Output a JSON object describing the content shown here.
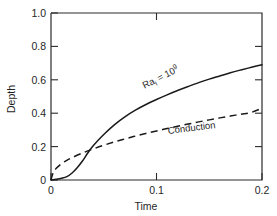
{
  "chart_data": {
    "type": "line",
    "title": "",
    "subtitle": "",
    "xlabel": "Time",
    "ylabel": "Depth",
    "xlim": [
      0,
      0.2
    ],
    "ylim": [
      0,
      1.0
    ],
    "grid": false,
    "legend_position": "inline-annotation",
    "xticks": [
      0,
      0.1,
      0.2
    ],
    "xticklabels": [
      "0",
      "0.1",
      "0.2"
    ],
    "yticks": [
      0,
      0.2,
      0.4,
      0.6,
      0.8,
      1.0
    ],
    "yticklabels": [
      "0",
      "0.2",
      "0.4",
      "0.6",
      "0.8",
      "1.0"
    ],
    "series": [
      {
        "name": "Ra_i = 10^9",
        "style": "solid",
        "x": [
          0,
          0.005,
          0.01,
          0.015,
          0.02,
          0.025,
          0.03,
          0.035,
          0.04,
          0.05,
          0.06,
          0.07,
          0.08,
          0.09,
          0.1,
          0.11,
          0.12,
          0.13,
          0.14,
          0.15,
          0.16,
          0.17,
          0.18,
          0.19,
          0.2
        ],
        "y": [
          0.0,
          0.004,
          0.01,
          0.02,
          0.042,
          0.075,
          0.115,
          0.163,
          0.205,
          0.272,
          0.33,
          0.378,
          0.418,
          0.452,
          0.482,
          0.51,
          0.536,
          0.56,
          0.583,
          0.604,
          0.623,
          0.642,
          0.659,
          0.675,
          0.69
        ]
      },
      {
        "name": "Conduction",
        "style": "dashed",
        "x": [
          0,
          0.002,
          0.005,
          0.01,
          0.015,
          0.02,
          0.03,
          0.04,
          0.05,
          0.06,
          0.07,
          0.08,
          0.09,
          0.1,
          0.11,
          0.12,
          0.13,
          0.14,
          0.15,
          0.16,
          0.17,
          0.18,
          0.19,
          0.2
        ],
        "y": [
          0.0,
          0.042,
          0.07,
          0.098,
          0.118,
          0.134,
          0.162,
          0.186,
          0.208,
          0.228,
          0.246,
          0.263,
          0.279,
          0.294,
          0.308,
          0.322,
          0.335,
          0.348,
          0.36,
          0.372,
          0.383,
          0.394,
          0.405,
          0.43
        ]
      }
    ],
    "annotations": [
      {
        "name": "rayleigh-label",
        "base": "Ra",
        "subscript": "i",
        "relation": " = 10",
        "superscript": "9",
        "x": 0.105,
        "y": 0.6,
        "rotation": -27
      },
      {
        "name": "conduction-label",
        "text": "Conduction",
        "x": 0.133,
        "y": 0.305,
        "rotation": -7
      }
    ]
  }
}
